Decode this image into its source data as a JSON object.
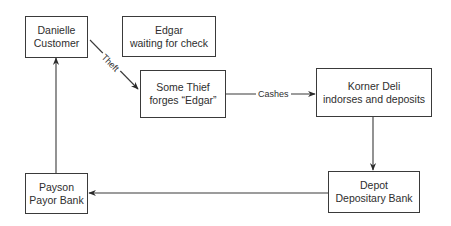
{
  "diagram": {
    "type": "flowchart",
    "nodes": [
      {
        "id": "danielle",
        "line1": "Danielle",
        "line2": "Customer"
      },
      {
        "id": "edgar",
        "line1": "Edgar",
        "line2": "waiting for check"
      },
      {
        "id": "thief",
        "line1": "Some Thief",
        "line2": "forges “Edgar”"
      },
      {
        "id": "korner",
        "line1": "Korner Deli",
        "line2": "indorses and deposits"
      },
      {
        "id": "depot",
        "line1": "Depot",
        "line2": "Depositary Bank"
      },
      {
        "id": "payson",
        "line1": "Payson",
        "line2": "Payor Bank"
      }
    ],
    "edges": [
      {
        "from": "danielle",
        "to": "thief",
        "label": "Theft"
      },
      {
        "from": "thief",
        "to": "korner",
        "label": "Cashes"
      },
      {
        "from": "korner",
        "to": "depot",
        "label": ""
      },
      {
        "from": "depot",
        "to": "payson",
        "label": ""
      },
      {
        "from": "payson",
        "to": "danielle",
        "label": ""
      }
    ]
  },
  "colors": {
    "line": "#3a3a3a",
    "text": "#2e2e2e",
    "background": "#ffffff"
  }
}
